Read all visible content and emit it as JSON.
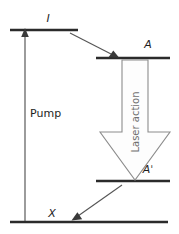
{
  "diagram": {
    "type": "energy-level-diagram",
    "title": "",
    "levels": [
      {
        "id": "upper-pump-level",
        "label": "I",
        "style": "italic",
        "y": 30,
        "x1": 10,
        "x2": 78,
        "label_x": 48,
        "label_y": 22
      },
      {
        "id": "upper-laser-level",
        "label": "A",
        "style": "italic",
        "y": 58,
        "x1": 96,
        "x2": 170,
        "label_x": 148,
        "label_y": 48
      },
      {
        "id": "lower-laser-level",
        "label": "Aˈ",
        "style": "italic",
        "y": 181,
        "x1": 96,
        "x2": 170,
        "label_x": 148,
        "label_y": 173
      },
      {
        "id": "ground-level",
        "label": "X",
        "style": "italic",
        "y": 222,
        "x1": 10,
        "x2": 168,
        "label_x": 52,
        "label_y": 216
      }
    ],
    "transitions": [
      {
        "id": "pump-transition",
        "label": "Pump",
        "style": "plain",
        "kind": "vertical-arrow-up",
        "from": {
          "x": 25,
          "y": 222
        },
        "to": {
          "x": 25,
          "y": 31
        },
        "label_x": 30,
        "label_y": 117
      },
      {
        "id": "relaxation-i-to-a",
        "label": "",
        "kind": "diagonal-arrow",
        "from": {
          "x": 70,
          "y": 33
        },
        "to": {
          "x": 117,
          "y": 57
        }
      },
      {
        "id": "laser-action-transition",
        "label": "Laser action",
        "style": "rotated",
        "kind": "block-arrow-down",
        "from": {
          "x": 135,
          "y": 60
        },
        "to": {
          "x": 135,
          "y": 180
        },
        "label_x": 138,
        "label_y": 122
      },
      {
        "id": "relaxation-aprime-to-x",
        "label": "",
        "kind": "diagonal-arrow",
        "from": {
          "x": 122,
          "y": 185
        },
        "to": {
          "x": 73,
          "y": 219
        }
      }
    ],
    "colors": {
      "level_line": "#2b2b2b",
      "thin_arrow": "#555555",
      "block_arrow_stroke": "#8c8c8c",
      "block_arrow_fill": "#fdfdfd",
      "label_text": "#1e1e1e",
      "rotated_label_text": "#6f6f6f",
      "background": "#ffffff"
    }
  }
}
